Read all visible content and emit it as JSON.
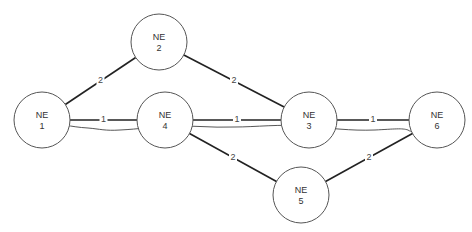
{
  "diagram": {
    "nodes": [
      {
        "id": "NE1",
        "line1": "NE",
        "line2": "1",
        "cx": 42,
        "cy": 120,
        "r": 28
      },
      {
        "id": "NE2",
        "line1": "NE",
        "line2": "2",
        "cx": 159,
        "cy": 42,
        "r": 28
      },
      {
        "id": "NE3",
        "line1": "NE",
        "line2": "3",
        "cx": 309,
        "cy": 120,
        "r": 28
      },
      {
        "id": "NE4",
        "line1": "NE",
        "line2": "4",
        "cx": 165,
        "cy": 120,
        "r": 28
      },
      {
        "id": "NE5",
        "line1": "NE",
        "line2": "5",
        "cx": 301,
        "cy": 195,
        "r": 28
      },
      {
        "id": "NE6",
        "line1": "NE",
        "line2": "6",
        "cx": 437,
        "cy": 120,
        "r": 28
      }
    ],
    "links": [
      {
        "from": "NE1",
        "to": "NE2",
        "weight": "2"
      },
      {
        "from": "NE2",
        "to": "NE3",
        "weight": "2"
      },
      {
        "from": "NE1",
        "to": "NE4",
        "weight": "1"
      },
      {
        "from": "NE4",
        "to": "NE3",
        "weight": "1"
      },
      {
        "from": "NE3",
        "to": "NE6",
        "weight": "1"
      },
      {
        "from": "NE4",
        "to": "NE5",
        "weight": "2"
      },
      {
        "from": "NE5",
        "to": "NE6",
        "weight": "2"
      }
    ],
    "path_trace": {
      "description": "hand-drawn route from NE 1 to NE 6",
      "from": "NE1",
      "to": "NE6"
    }
  }
}
